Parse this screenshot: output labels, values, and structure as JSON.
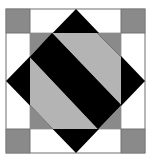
{
  "diagram": {
    "type": "quilt-block",
    "colors": {
      "background": "#ffffff",
      "border": "#6e6e6e",
      "dark_gray": "#8a8a8a",
      "light_gray": "#b4b4b4",
      "black": "#000000",
      "white": "#ffffff"
    }
  }
}
